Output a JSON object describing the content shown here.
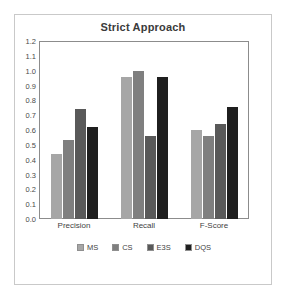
{
  "chart_data": {
    "type": "bar",
    "title": "Strict Approach",
    "xlabel": "",
    "ylabel": "",
    "categories": [
      "Precision",
      "Recall",
      "F-Score"
    ],
    "series": [
      {
        "name": "MS",
        "values": [
          0.44,
          0.96,
          0.6
        ],
        "color": "#a6a6a6"
      },
      {
        "name": "CS",
        "values": [
          0.53,
          1.0,
          0.56
        ],
        "color": "#7f7f7f"
      },
      {
        "name": "E3S",
        "values": [
          0.74,
          0.56,
          0.64
        ],
        "color": "#595959"
      },
      {
        "name": "DQS",
        "values": [
          0.62,
          0.96,
          0.755
        ],
        "color": "#1f1f1f"
      }
    ],
    "ylim": [
      0.0,
      1.2
    ],
    "yticks": [
      "1.2",
      "1.1",
      "1.0",
      "0.9",
      "0.8",
      "0.7",
      "0.6",
      "0.5",
      "0.4",
      "0.3",
      "0.2",
      "0.1",
      "0.0"
    ],
    "ytick_values": [
      1.2,
      1.1,
      1.0,
      0.9,
      0.8,
      0.7,
      0.6,
      0.5,
      0.4,
      0.3,
      0.2,
      0.1,
      0.0
    ],
    "grid": false,
    "legend_position": "bottom",
    "plot_border_color": "#8c8c8c",
    "figure_border_color": "#c9c9c9",
    "background": "#ffffff",
    "title_color": "#3b3b3b"
  }
}
